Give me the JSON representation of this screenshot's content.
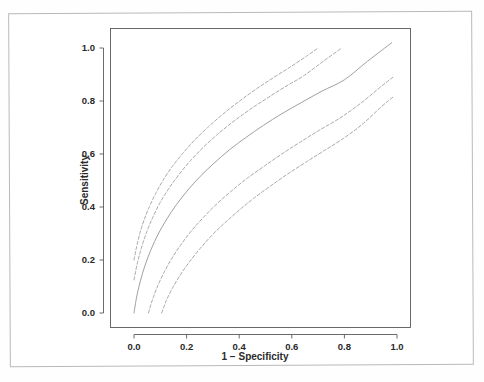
{
  "figure": {
    "background_color": "#ffffff",
    "border_color": "#b9b9b9",
    "axis_color": "#5a5a5a",
    "curve_color": "#9a9a9a",
    "label_color": "#2a2a2a"
  },
  "chart_data": {
    "type": "line",
    "title": "",
    "subtitle": "",
    "xlabel": "1 − Specificity",
    "ylabel": "Sensitivity",
    "xlim": [
      -0.06,
      1.06
    ],
    "ylim": [
      -0.06,
      1.08
    ],
    "xticks": [
      0.0,
      0.2,
      0.4,
      0.6,
      0.8,
      1.0
    ],
    "yticks": [
      0.0,
      0.2,
      0.4,
      0.6,
      0.8,
      1.0
    ],
    "xticklabels": [
      "0.0",
      "0.2",
      "0.4",
      "0.6",
      "0.8",
      "1.0"
    ],
    "yticklabels": [
      "0.0",
      "0.2",
      "0.4",
      "0.6",
      "0.8",
      "1.0"
    ],
    "grid": false,
    "legend": null,
    "legend_position": "none",
    "annotations": [],
    "series": [
      {
        "name": "Upper outer confidence band",
        "style": "dashed",
        "x": [
          0.0,
          0.01,
          0.022,
          0.038,
          0.058,
          0.082,
          0.11,
          0.145,
          0.185,
          0.23,
          0.28,
          0.335,
          0.395,
          0.46,
          0.53,
          0.6,
          0.66,
          0.7
        ],
        "y": [
          0.2,
          0.25,
          0.3,
          0.35,
          0.4,
          0.45,
          0.5,
          0.552,
          0.602,
          0.652,
          0.7,
          0.748,
          0.795,
          0.842,
          0.888,
          0.932,
          0.972,
          1.0
        ]
      },
      {
        "name": "Upper inner confidence band",
        "style": "dashed",
        "x": [
          0.0,
          0.012,
          0.028,
          0.048,
          0.072,
          0.1,
          0.134,
          0.172,
          0.215,
          0.262,
          0.315,
          0.372,
          0.435,
          0.502,
          0.572,
          0.645,
          0.72,
          0.79
        ],
        "y": [
          0.125,
          0.185,
          0.245,
          0.305,
          0.362,
          0.418,
          0.472,
          0.524,
          0.575,
          0.624,
          0.672,
          0.718,
          0.764,
          0.808,
          0.852,
          0.895,
          0.95,
          1.0
        ]
      },
      {
        "name": "ROC curve",
        "style": "solid",
        "x": [
          0.0,
          0.01,
          0.024,
          0.042,
          0.065,
          0.092,
          0.125,
          0.162,
          0.205,
          0.252,
          0.305,
          0.362,
          0.425,
          0.492,
          0.562,
          0.638,
          0.716,
          0.8,
          0.888,
          0.98
        ],
        "y": [
          0.0,
          0.06,
          0.12,
          0.18,
          0.24,
          0.298,
          0.355,
          0.41,
          0.464,
          0.516,
          0.566,
          0.615,
          0.662,
          0.708,
          0.752,
          0.795,
          0.838,
          0.88,
          0.95,
          1.02
        ]
      },
      {
        "name": "Lower inner confidence band",
        "style": "dashed",
        "x": [
          0.055,
          0.07,
          0.09,
          0.115,
          0.145,
          0.18,
          0.22,
          0.265,
          0.315,
          0.37,
          0.43,
          0.495,
          0.562,
          0.632,
          0.705,
          0.782,
          0.86,
          0.94,
          0.985
        ],
        "y": [
          0.0,
          0.05,
          0.102,
          0.155,
          0.208,
          0.26,
          0.312,
          0.362,
          0.412,
          0.46,
          0.508,
          0.554,
          0.6,
          0.645,
          0.69,
          0.735,
          0.79,
          0.855,
          0.89
        ]
      },
      {
        "name": "Lower outer confidence band",
        "style": "dashed",
        "x": [
          0.105,
          0.122,
          0.145,
          0.175,
          0.21,
          0.25,
          0.295,
          0.345,
          0.4,
          0.458,
          0.52,
          0.585,
          0.652,
          0.722,
          0.795,
          0.868,
          0.94,
          0.985
        ],
        "y": [
          0.0,
          0.045,
          0.092,
          0.142,
          0.192,
          0.242,
          0.292,
          0.34,
          0.388,
          0.435,
          0.48,
          0.525,
          0.568,
          0.612,
          0.658,
          0.712,
          0.778,
          0.815
        ]
      }
    ]
  }
}
